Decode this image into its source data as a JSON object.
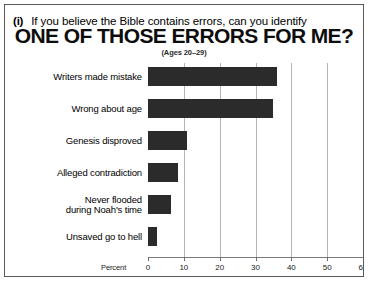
{
  "figure": {
    "marker": "(i)",
    "headline_small": "If you believe the Bible contains errors, can you identify",
    "headline_big": "ONE OF THOSE ERRORS FOR ME?",
    "subtitle": "(Ages 20–29)",
    "axis_label": "Percent",
    "bar_color": "#2b2b2b",
    "grid_color": "#b4b4b4",
    "frame_color": "#5a5a5a"
  },
  "chart_data": {
    "type": "bar",
    "orientation": "horizontal",
    "title": "ONE OF THOSE ERRORS FOR ME?",
    "subtitle": "(Ages 20–29)",
    "xlabel": "Percent",
    "ylabel": "",
    "xlim": [
      0,
      60
    ],
    "xticks": [
      0,
      10,
      20,
      30,
      40,
      50,
      60
    ],
    "xtick_labels": [
      "0",
      "10",
      "20",
      "30",
      "40",
      "50",
      "60"
    ],
    "grid": true,
    "legend": false,
    "categories": [
      "Writers made mistake",
      "Wrong about age",
      "Genesis disproved",
      "Alleged contradiction",
      "Never flooded\nduring Noah's time",
      "Unsaved go to hell"
    ],
    "category_labels": [
      [
        "Writers made mistake"
      ],
      [
        "Wrong about age"
      ],
      [
        "Genesis disproved"
      ],
      [
        "Alleged contradiction"
      ],
      [
        "Never flooded",
        "during Noah's time"
      ],
      [
        "Unsaved go to hell"
      ]
    ],
    "values": [
      36,
      35,
      11,
      8.5,
      6.5,
      2.5
    ]
  }
}
